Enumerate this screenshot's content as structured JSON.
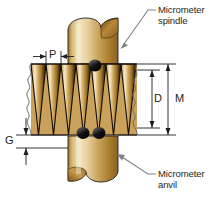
{
  "figure": {
    "background_color": "#ffffff",
    "line_color": "#231f20",
    "leader_color": "#808285"
  },
  "callouts": [
    {
      "id": "spindle",
      "line1": "Micrometer",
      "line2": "spindle",
      "text_x": 158,
      "text_y": 6,
      "leader_from_x": 148,
      "leader_from_y": 11,
      "leader_to_x": 121,
      "leader_to_y": 47
    },
    {
      "id": "anvil",
      "line1": "Micrometer",
      "line2": "anvil",
      "text_x": 158,
      "text_y": 168,
      "leader_from_x": 148,
      "leader_from_y": 174,
      "leader_to_x": 116,
      "leader_to_y": 152
    }
  ],
  "dimensions": [
    {
      "id": "pitch",
      "label": "P",
      "orientation": "horizontal",
      "label_x": 45,
      "label_y": 50,
      "line_y": 56,
      "x_start": 31,
      "x_end": 64,
      "description": "Thread pitch"
    },
    {
      "id": "minor-diameter",
      "label": "D",
      "orientation": "vertical",
      "label_x": 155,
      "label_y": 94,
      "line_x": 152,
      "y_top": 70,
      "y_bottom": 128,
      "description": "Thread minor diameter"
    },
    {
      "id": "major-diameter",
      "label": "M",
      "orientation": "vertical",
      "label_x": 176,
      "label_y": 94,
      "line_x": 168,
      "y_top": 64,
      "y_bottom": 135,
      "description": "Thread major diameter"
    },
    {
      "id": "gap",
      "label": "G",
      "orientation": "vertical",
      "label_x": 6,
      "label_y": 135,
      "line_x": 26,
      "y_top": 124,
      "y_bottom": 148,
      "description": "Gap clearance"
    }
  ],
  "parts": {
    "spindle": {
      "name": "Micrometer spindle",
      "x": 68,
      "y": 18,
      "width": 50,
      "height": 46,
      "fill_light": "#f4e2bd",
      "fill_mid": "#c79a4b",
      "fill_dark": "#8a6220"
    },
    "anvil": {
      "name": "Micrometer anvil",
      "x": 68,
      "y": 136,
      "width": 50,
      "height": 47,
      "fill_light": "#f4e2bd",
      "fill_mid": "#c79a4b",
      "fill_dark": "#8a6220"
    },
    "screw": {
      "name": "Threaded screw shaft",
      "x": 31,
      "y": 64,
      "width": 106,
      "height": 71,
      "thread_count": 7,
      "pitch_px": 15,
      "crest_fill": "#f6e8c6",
      "root_fill": "#3d2a0c",
      "flank_fill": "#b8873b"
    },
    "balls": [
      {
        "name": "contact-ball-top",
        "cx": 95,
        "cy": 66,
        "r": 6
      },
      {
        "name": "contact-ball-bottom-left",
        "cx": 83,
        "cy": 132,
        "r": 6
      },
      {
        "name": "contact-ball-bottom-right",
        "cx": 99,
        "cy": 132,
        "r": 6
      }
    ]
  }
}
